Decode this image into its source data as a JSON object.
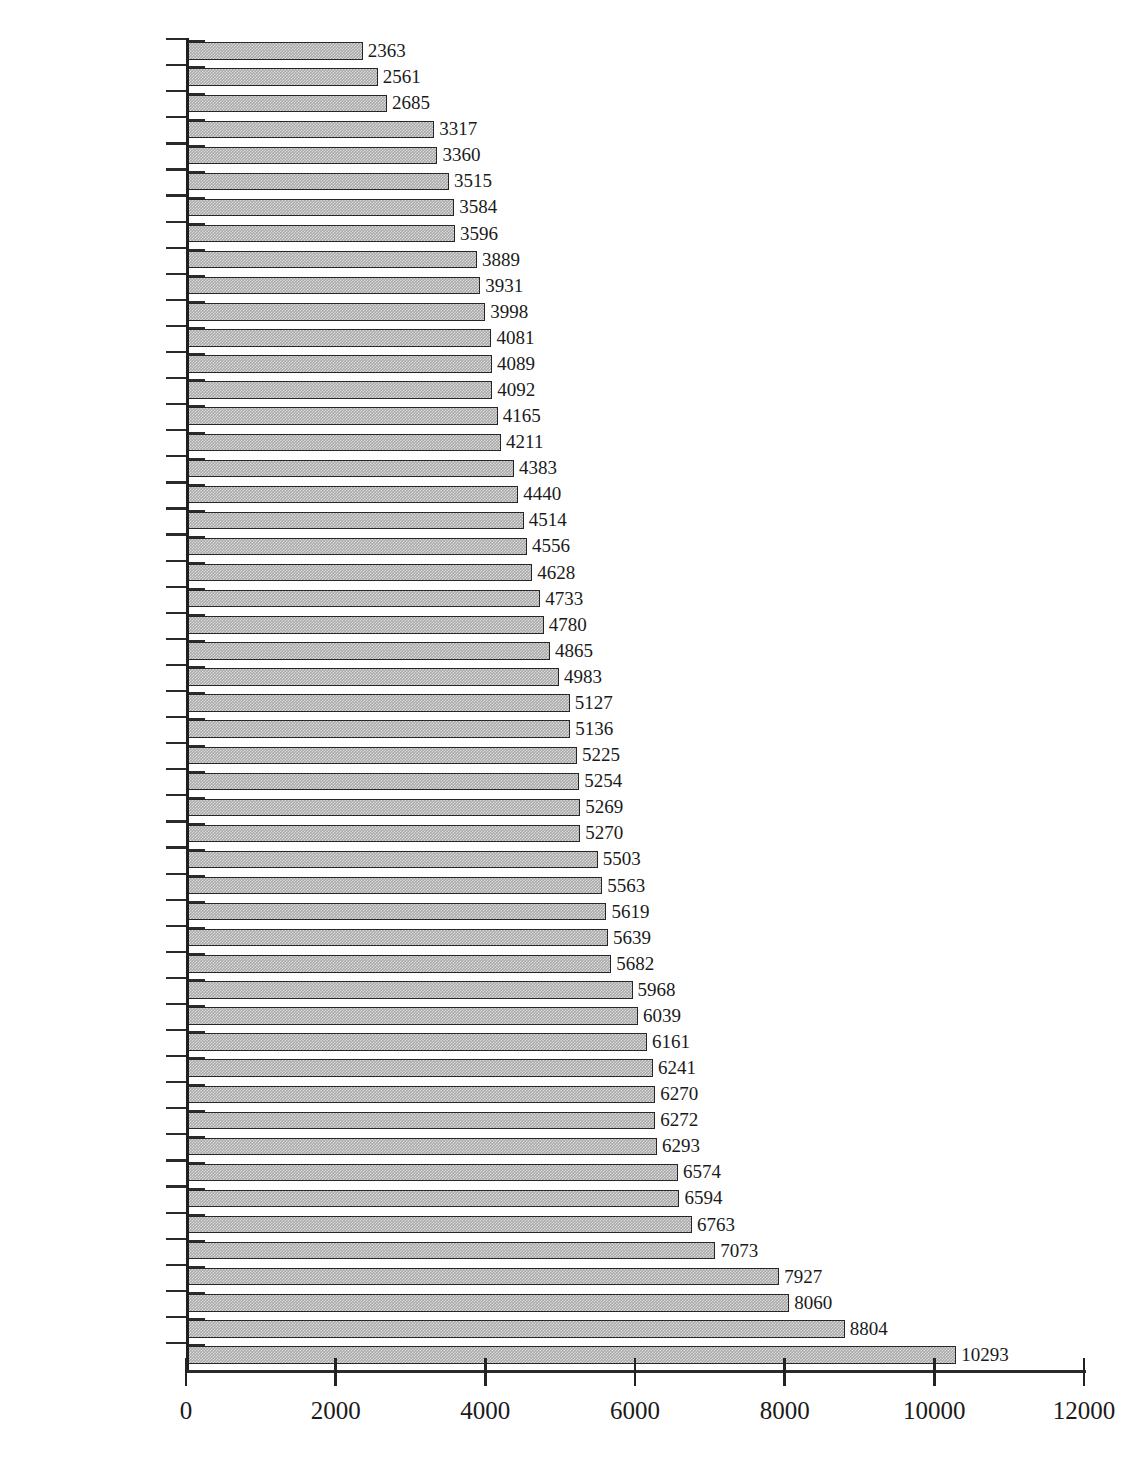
{
  "chart_data": {
    "type": "bar",
    "orientation": "horizontal",
    "title": "",
    "xlabel": "",
    "ylabel": "",
    "xlim": [
      0,
      12000
    ],
    "xticks": [
      0,
      2000,
      4000,
      6000,
      8000,
      10000,
      12000
    ],
    "xtick_labels": [
      "0",
      "2000",
      "4000",
      "6000",
      "8000",
      "10000",
      "12000"
    ],
    "grid": false,
    "legend": null,
    "bar_color": "#a9a9a9",
    "bar_border_color": "#262626",
    "axis_color": "#232323",
    "data_labels": true,
    "sorted": "ascending",
    "categories": [
      "West Virginia",
      "North Dakota",
      "South Dakota",
      "Kentucky",
      "Pennsylvania",
      "Mississippi",
      "Maine",
      "New Hampshire",
      "Wyoming",
      "Idaho",
      "Montana",
      "Iowa",
      "Vermont",
      "Nebraska",
      "Wiscnosin",
      "Virginia",
      "Minnesota",
      "Indiana",
      "Tennessee",
      "Arkansas",
      "Alabama",
      "Ohio",
      "Alaska",
      "Deleware",
      "Kansas",
      "Missouri",
      "Massachusetts",
      "Rhode Island",
      "North Carolina",
      "New Jersey",
      "Connecticut",
      "Oklahoma",
      "Maryland",
      "South Carolina",
      "Illinois",
      "Utah",
      "Michigan",
      "Colorado",
      "Oregon",
      "Louisiana",
      "Hawaii",
      "Nevada",
      "New York",
      "New Mexico",
      "Washington",
      "California",
      "Georgia",
      "Texas",
      "Arizona",
      "Florida",
      "District of Columbia"
    ],
    "values": [
      2363,
      2561,
      2685,
      3317,
      3360,
      3515,
      3584,
      3596,
      3889,
      3931,
      3998,
      4081,
      4089,
      4092,
      4165,
      4211,
      4383,
      4440,
      4514,
      4556,
      4628,
      4733,
      4780,
      4865,
      4983,
      5127,
      5136,
      5225,
      5254,
      5269,
      5270,
      5503,
      5563,
      5619,
      5639,
      5682,
      5968,
      6039,
      6161,
      6241,
      6270,
      6272,
      6293,
      6574,
      6594,
      6763,
      7073,
      7927,
      8060,
      8804,
      10293
    ]
  },
  "caption": {
    "text": ""
  }
}
